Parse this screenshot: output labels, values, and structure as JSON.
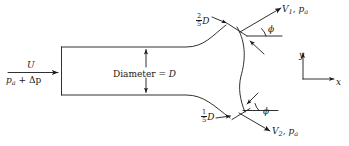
{
  "figure": {
    "stroke_color": "#1a1a1a",
    "background_color": "#ffffff"
  },
  "labels": {
    "inlet_velocity": "U",
    "inlet_pressure_base": "p",
    "inlet_pressure_sub": "a",
    "inlet_pressure_delta": " + Δp",
    "diameter": "Diameter = ",
    "diameter_symbol": "D",
    "top_exit_width_num": "2",
    "top_exit_width_den": "5",
    "top_exit_width_symbol": "D",
    "bottom_exit_width_num": "1",
    "bottom_exit_width_den": "5",
    "bottom_exit_width_symbol": "D",
    "outlet_top_velocity": "V",
    "outlet_top_velocity_sub": "1",
    "outlet_top_separator": ", ",
    "outlet_top_pressure": "p",
    "outlet_top_pressure_sub": "a",
    "outlet_bottom_velocity": "V",
    "outlet_bottom_velocity_sub": "2",
    "outlet_bottom_separator": ", ",
    "outlet_bottom_pressure": "p",
    "outlet_bottom_pressure_sub": "a",
    "angle_top": "ϕ",
    "angle_bottom": "ϕ",
    "axis_y": "y",
    "axis_x": "x"
  },
  "icons": {
    "inlet_flow_arrow": "arrow-right-icon",
    "diameter_dimension": "double-arrow-vertical-icon",
    "top_outlet_arrow": "arrow-up-right-icon",
    "bottom_outlet_arrow": "arrow-down-right-icon",
    "top_leader_arrow": "leader-arrow-icon",
    "bottom_leader_arrow": "leader-arrow-icon",
    "axis_y_arrow": "arrow-up-icon",
    "axis_x_arrow": "arrow-right-icon"
  }
}
